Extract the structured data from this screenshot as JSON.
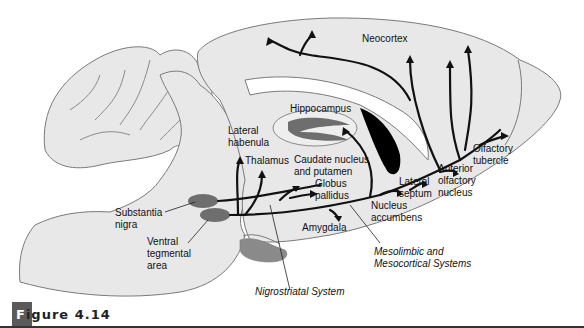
{
  "figure": {
    "caption_first_letter": "F",
    "caption_rest": "igure 4.14"
  },
  "colors": {
    "brain_fill": "#e8e8e8",
    "outline": "#7a7a7a",
    "nuclei_fill": "#6e6e6e",
    "pathway": "#111111",
    "ventricle": "#000000"
  },
  "labels": {
    "neocortex": "Neocortex",
    "hippocampus": "Hippocampus",
    "lateral_habenula": "Lateral\nhabenula",
    "thalamus": "Thalamus",
    "caudate": "Caudate nucleus\nand putamen",
    "globus_pallidus": "Globus\npallidus",
    "olfactory_tubercle": "Olfactory\ntubercle",
    "anterior_olfactory": "Anterior\nolfactory\nnucleus",
    "lateral_septum": "Lateral\nseptum",
    "nucleus_accumbens": "Nucleus\naccumbens",
    "amygdala": "Amygdala",
    "substantia_nigra": "Substantia\nnigra",
    "vta": "Ventral\ntegmental\narea",
    "mesolimbic": "Mesolimbic and\nMesocortical Systems",
    "nigrostriatal": "Nigrostriatal System"
  }
}
